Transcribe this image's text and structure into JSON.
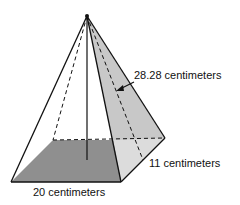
{
  "diagram": {
    "type": "square pyramid",
    "labels": {
      "slant_height": "28.28 centimeters",
      "height_segment": "11 centimeters",
      "base_edge": "20 centimeters"
    },
    "colors": {
      "base_fill": "#8f8f8f",
      "right_face_fill": "#c8c8c8",
      "lower_right_fill": "#dcdcdc",
      "stroke": "#111111"
    }
  }
}
